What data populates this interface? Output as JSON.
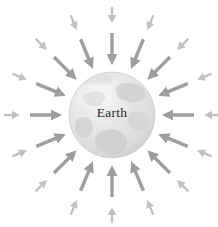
{
  "figure": {
    "name": "earth-gravity-field-diagram",
    "background_color": "#ffffff",
    "width": 218,
    "height": 227
  },
  "globe": {
    "label": "Earth",
    "label_color": "#2b2b2b",
    "center_x": 112,
    "center_y": 115,
    "radius": 43,
    "body_color": "#e3e3e3",
    "highlight_color": "#f4f4f4",
    "shadow_color": "#c9c9c9",
    "land_color": "#d2d2d2",
    "label_offset_y": -1
  },
  "field": {
    "description": "inward-pointing gravitational field arrows",
    "direction": "inward",
    "count_per_ring": 16,
    "angle_step_degrees": 22.5,
    "angle_start_degrees": 0,
    "rings": [
      {
        "name": "inner-ring",
        "color": "#9e9e9e",
        "tail_radius": 82,
        "head_radius": 50,
        "shaft_width": 3.4,
        "head_length": 11,
        "head_width": 11
      },
      {
        "name": "outer-ring",
        "color": "#c2c2c2",
        "tail_radius": 108,
        "head_radius": 92,
        "shaft_width": 2.4,
        "head_length": 8,
        "head_width": 8.4
      }
    ]
  }
}
